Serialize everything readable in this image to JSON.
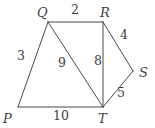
{
  "figure": {
    "stroke_color": "#4a4a4a",
    "text_color": "#3f3f3f",
    "background_color": "#ffffff",
    "stroke_width": 1
  },
  "vertices": [
    {
      "name": "P",
      "label": "P",
      "x": 18,
      "y": 107,
      "label_x": 3,
      "label_y": 112
    },
    {
      "name": "Q",
      "label": "Q",
      "x": 48,
      "y": 22,
      "label_x": 37,
      "label_y": 6
    },
    {
      "name": "R",
      "label": "R",
      "x": 103,
      "y": 22,
      "label_x": 100,
      "label_y": 6
    },
    {
      "name": "S",
      "label": "S",
      "x": 133,
      "y": 71,
      "label_x": 139,
      "label_y": 66
    },
    {
      "name": "T",
      "label": "T",
      "x": 103,
      "y": 107,
      "label_x": 98,
      "label_y": 112
    }
  ],
  "edges": [
    {
      "name": "PQ",
      "from": "P",
      "to": "Q",
      "length": "3",
      "label_x": 17,
      "label_y": 50
    },
    {
      "name": "QR",
      "from": "Q",
      "to": "R",
      "length": "2",
      "label_x": 71,
      "label_y": 4
    },
    {
      "name": "RS",
      "from": "R",
      "to": "S",
      "length": "4",
      "label_x": 120,
      "label_y": 29
    },
    {
      "name": "ST",
      "from": "S",
      "to": "T",
      "length": "5",
      "label_x": 117,
      "label_y": 87
    },
    {
      "name": "TP",
      "from": "T",
      "to": "P",
      "length": "10",
      "label_x": 53,
      "label_y": 110
    },
    {
      "name": "QT",
      "from": "Q",
      "to": "T",
      "length": "9",
      "label_x": 58,
      "label_y": 57
    },
    {
      "name": "RT",
      "from": "R",
      "to": "T",
      "length": "8",
      "label_x": 94,
      "label_y": 55
    }
  ],
  "chart_data": {
    "type": "diagram",
    "points": {
      "P": [
        18,
        107
      ],
      "Q": [
        48,
        22
      ],
      "R": [
        103,
        22
      ],
      "S": [
        133,
        71
      ],
      "T": [
        103,
        107
      ]
    },
    "segments": [
      {
        "endpoints": [
          "P",
          "Q"
        ],
        "length": 3
      },
      {
        "endpoints": [
          "Q",
          "R"
        ],
        "length": 2
      },
      {
        "endpoints": [
          "R",
          "S"
        ],
        "length": 4
      },
      {
        "endpoints": [
          "S",
          "T"
        ],
        "length": 5
      },
      {
        "endpoints": [
          "T",
          "P"
        ],
        "length": 10
      },
      {
        "endpoints": [
          "Q",
          "T"
        ],
        "length": 9
      },
      {
        "endpoints": [
          "R",
          "T"
        ],
        "length": 8
      }
    ],
    "vertex_labels": [
      "P",
      "Q",
      "R",
      "S",
      "T"
    ],
    "length_labels": [
      "3",
      "2",
      "4",
      "5",
      "10",
      "9",
      "8"
    ],
    "grid": false,
    "legend": "none"
  }
}
